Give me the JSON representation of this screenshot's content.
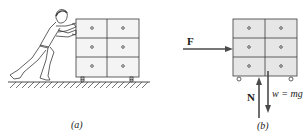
{
  "figure": {
    "panel_a": {
      "caption": "(a)",
      "description": "Person pushing a cabinet with six drawers on wheels across a floor"
    },
    "panel_b": {
      "caption": "(b)",
      "description": "Free-body diagram of the cabinet",
      "forces": [
        {
          "symbol": "F",
          "direction": "right",
          "label": "F"
        },
        {
          "symbol": "N",
          "direction": "up",
          "label": "N"
        },
        {
          "symbol": "w",
          "direction": "down",
          "label": "w = mg"
        }
      ]
    },
    "colors": {
      "line": "#3a3a3a",
      "cabinet_fill_b": "#e6e6e6",
      "arrow": "#4a4a4a"
    }
  }
}
